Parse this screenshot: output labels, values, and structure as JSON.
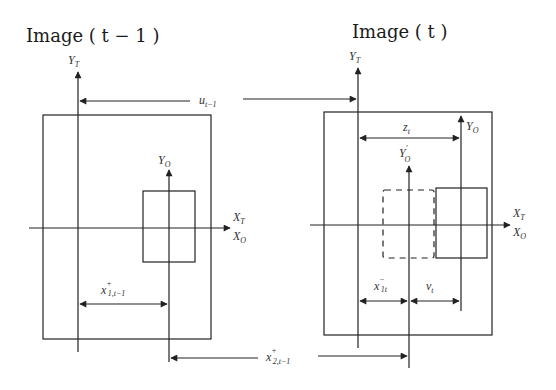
{
  "titles": {
    "left": "Image ( t − 1 )",
    "right": "Image ( t )"
  },
  "left_panel": {
    "axis_y_target": {
      "main": "Y",
      "sub": "T"
    },
    "axis_y_object": {
      "main": "Y",
      "sub": "O"
    },
    "axis_x_target": {
      "main": "X",
      "sub": "T"
    },
    "axis_x_object": {
      "main": "X",
      "sub": "O"
    },
    "dimension_x1": {
      "main": "x",
      "sup": "+",
      "sub": "1,t−1"
    }
  },
  "right_panel": {
    "axis_y_target": {
      "main": "Y",
      "sub": "T"
    },
    "axis_y_object": {
      "main": "Y",
      "sub": "O"
    },
    "axis_y_object_prev": {
      "main": "Y",
      "sup": "′",
      "sub": "O"
    },
    "axis_x_target": {
      "main": "X",
      "sub": "T"
    },
    "axis_x_object": {
      "main": "X",
      "sub": "O"
    },
    "dimension_z": {
      "main": "z",
      "sub": "t"
    },
    "dimension_x1_minus": {
      "main": "x",
      "sup": "−",
      "sub": "1t"
    },
    "dimension_v": {
      "main": "v",
      "sub": "t"
    }
  },
  "shared": {
    "dimension_u": {
      "main": "u",
      "sub": "t−1"
    },
    "dimension_x2": {
      "main": "x",
      "sup": "+",
      "sub": "2,t−1"
    }
  }
}
